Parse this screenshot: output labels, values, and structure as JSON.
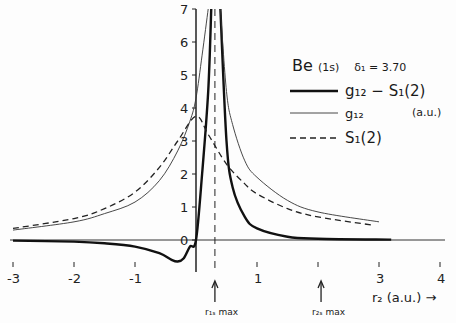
{
  "chart_data": {
    "type": "line",
    "xlabel": "r2 (a.u.)",
    "ylabel": "(a.u.)",
    "xlim": [
      -3.2,
      4.2
    ],
    "ylim": [
      -0.6,
      7
    ],
    "x_ticks": [
      -3,
      -2,
      -1,
      0,
      1,
      2,
      3,
      4
    ],
    "x_tick_labels": [
      "-3",
      "-2",
      "-1",
      "",
      "1",
      "",
      "3",
      "4"
    ],
    "y_ticks": [
      0,
      1,
      2,
      3,
      4,
      5,
      6,
      7
    ],
    "y_tick_labels": [
      "0",
      "1",
      "2",
      "3",
      "4",
      "5",
      "6",
      "7"
    ],
    "grid": false,
    "legend_position": "upper right",
    "annotations": [
      {
        "text": "r1s max",
        "x": 0.31,
        "type": "arrow + dashed vertical line"
      },
      {
        "text": "r2s max",
        "x": 2.05,
        "type": "arrow"
      }
    ],
    "series": [
      {
        "name": "g12 - S1(2)",
        "style": "thick solid",
        "x": [
          -3.0,
          -2.0,
          -1.5,
          -1.0,
          -0.6,
          -0.4,
          -0.3,
          -0.2,
          -0.1,
          0.0,
          0.1,
          0.2,
          0.25,
          0.4,
          0.5,
          0.6,
          0.8,
          1.0,
          1.5,
          2.0,
          3.2
        ],
        "y": [
          -0.02,
          -0.05,
          -0.1,
          -0.2,
          -0.4,
          -0.6,
          -0.65,
          -0.55,
          -0.2,
          0.0,
          2.0,
          4.5,
          7.0,
          7.0,
          3.0,
          1.6,
          0.7,
          0.35,
          0.1,
          0.04,
          0.01
        ]
      },
      {
        "name": "g12",
        "style": "thin solid",
        "x": [
          -3.0,
          -2.0,
          -1.5,
          -1.0,
          -0.6,
          -0.3,
          -0.1,
          0.0,
          0.1,
          0.2,
          0.4,
          0.5,
          0.6,
          0.8,
          1.0,
          1.5,
          2.0,
          3.0
        ],
        "y": [
          0.3,
          0.55,
          0.8,
          1.15,
          1.8,
          2.7,
          3.6,
          4.3,
          5.6,
          7.0,
          7.0,
          4.5,
          3.5,
          2.4,
          1.9,
          1.2,
          0.85,
          0.55
        ]
      },
      {
        "name": "S1(2)",
        "style": "dashed",
        "x": [
          -3.0,
          -2.0,
          -1.5,
          -1.0,
          -0.6,
          -0.3,
          0.0,
          0.2,
          0.5,
          0.8,
          1.0,
          1.5,
          2.0,
          2.9
        ],
        "y": [
          0.35,
          0.65,
          0.95,
          1.45,
          2.2,
          3.0,
          3.75,
          3.2,
          2.3,
          1.7,
          1.4,
          0.95,
          0.7,
          0.45
        ]
      }
    ]
  },
  "legend": {
    "title_main": "Be",
    "title_state": "(1s)",
    "title_param": "δ₁ = 3.70",
    "items": [
      {
        "label": "g₁₂ − S₁(2)",
        "style": "thick"
      },
      {
        "label": "g₁₂",
        "style": "thin"
      },
      {
        "label": "S₁(2)",
        "style": "dashed"
      }
    ],
    "unit": "(a.u.)"
  },
  "axes": {
    "x_label": "r₂ (a.u.) →",
    "x_ticks": [
      "-3",
      "-2",
      "-1",
      "1",
      "3",
      "4"
    ],
    "y_ticks": [
      "0",
      "1",
      "2",
      "3",
      "4",
      "5",
      "6",
      "7"
    ],
    "r1s_label": "r₁ₛ max",
    "r2s_label": "r₂ₛ max"
  }
}
